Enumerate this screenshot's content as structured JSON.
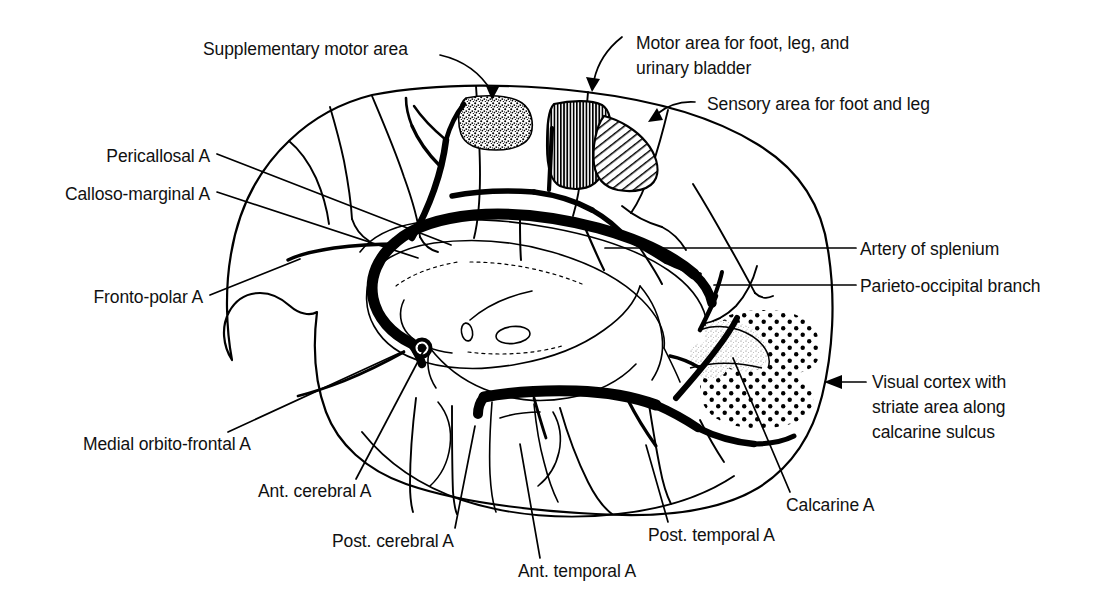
{
  "figure": {
    "kind": "anatomical-line-diagram",
    "background_color": "#ffffff",
    "ink_color": "#000000"
  },
  "labels": {
    "supplementary_motor_area": "Supplementary motor area",
    "motor_area_line1": "Motor area for foot, leg, and",
    "motor_area_line2": "urinary bladder",
    "sensory_area": "Sensory area for foot and leg",
    "pericallosal_a": "Pericallosal A",
    "calloso_marginal_a": "Calloso-marginal A",
    "fronto_polar_a": "Fronto-polar A",
    "medial_orbito_frontal_a": "Medial orbito-frontal A",
    "ant_cerebral_a": "Ant. cerebral A",
    "post_cerebral_a": "Post. cerebral A",
    "ant_temporal_a": "Ant. temporal A",
    "post_temporal_a": "Post. temporal A",
    "artery_of_splenium": "Artery of splenium",
    "parieto_occipital_branch": "Parieto-occipital branch",
    "calcarine_a": "Calcarine A",
    "visual_cortex_line1": "Visual cortex with",
    "visual_cortex_line2": "striate area along",
    "visual_cortex_line3": "calcarine sulcus"
  },
  "regions": {
    "supplementary_motor_area_fill": "stipple-dense",
    "motor_area_fill": "vertical-hatch",
    "sensory_area_fill": "diagonal-hatch",
    "visual_cortex_fill": "polka-dot",
    "striate_area_fill": "fine-stipple"
  },
  "colors": {
    "ink": "#000000",
    "paper": "#ffffff",
    "text": "#111111"
  }
}
